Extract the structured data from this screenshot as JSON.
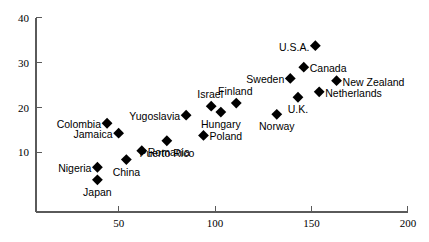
{
  "chart_data": {
    "type": "scatter",
    "title": "",
    "subtitle": "",
    "xlabel": "",
    "ylabel": "",
    "xlim": [
      0,
      200
    ],
    "ylim": [
      0,
      40
    ],
    "grid": false,
    "legend": "none",
    "xticks": [
      50,
      100,
      150,
      200
    ],
    "yticks": [
      10,
      20,
      30,
      40
    ],
    "marker": "diamond",
    "marker_color": "#000000",
    "axis_color": "#5a5a5a",
    "points": [
      {
        "label": "Nigeria",
        "x": 39,
        "y": 6.7,
        "label_pos": "left"
      },
      {
        "label": "Japan",
        "x": 39,
        "y": 3.9,
        "label_pos": "below"
      },
      {
        "label": "Colombia",
        "x": 44,
        "y": 16.5,
        "label_pos": "left"
      },
      {
        "label": "Jamaica",
        "x": 50,
        "y": 14.3,
        "label_pos": "left"
      },
      {
        "label": "China",
        "x": 54,
        "y": 8.4,
        "label_pos": "below"
      },
      {
        "label": "Romania",
        "x": 62,
        "y": 10.4,
        "label_pos": "right"
      },
      {
        "label": "Puerto Rico",
        "x": 75,
        "y": 12.6,
        "label_pos": "below"
      },
      {
        "label": "Yugoslavia",
        "x": 85,
        "y": 18.3,
        "label_pos": "left"
      },
      {
        "label": "Poland",
        "x": 94,
        "y": 13.8,
        "label_pos": "right"
      },
      {
        "label": "Israel",
        "x": 98,
        "y": 20.3,
        "label_pos": "above"
      },
      {
        "label": "Hungary",
        "x": 103,
        "y": 19.0,
        "label_pos": "below"
      },
      {
        "label": "Finland",
        "x": 111,
        "y": 21.0,
        "label_pos": "above"
      },
      {
        "label": "Norway",
        "x": 132,
        "y": 18.5,
        "label_pos": "below"
      },
      {
        "label": "U.K.",
        "x": 143,
        "y": 22.3,
        "label_pos": "below"
      },
      {
        "label": "Sweden",
        "x": 139,
        "y": 26.5,
        "label_pos": "left"
      },
      {
        "label": "Canada",
        "x": 146,
        "y": 29.0,
        "label_pos": "right"
      },
      {
        "label": "U.S.A.",
        "x": 152,
        "y": 33.8,
        "label_pos": "left"
      },
      {
        "label": "Netherlands",
        "x": 154,
        "y": 23.5,
        "label_pos": "right"
      },
      {
        "label": "New Zealand",
        "x": 163,
        "y": 26.0,
        "label_pos": "right"
      }
    ]
  }
}
